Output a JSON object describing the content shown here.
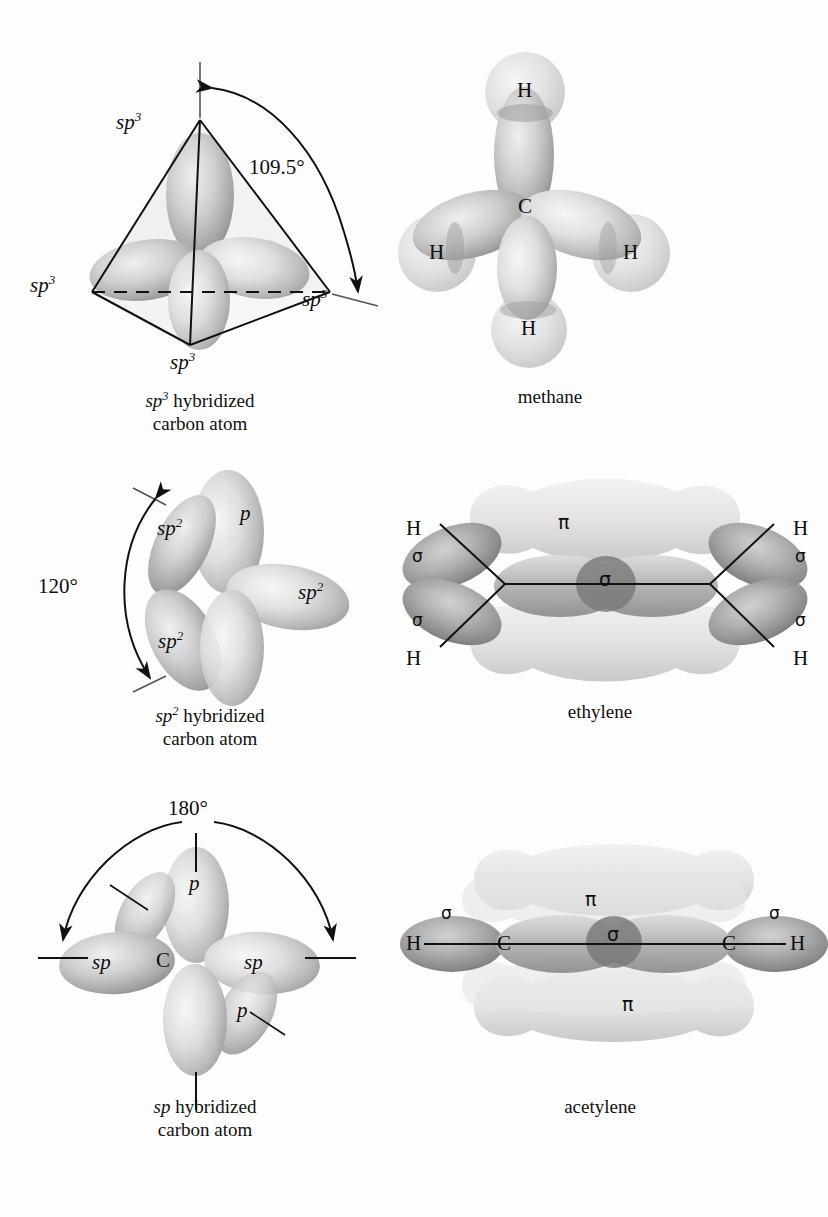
{
  "figure": {
    "background_color": "#fdfdfd",
    "ink_color": "#111111",
    "orbital_light": "#ececec",
    "orbital_mid": "#c9c9c9",
    "orbital_dark": "#8f8f8f",
    "orbital_shadow": "#6f6f6f"
  },
  "panels": [
    {
      "id": "sp3-carbon",
      "caption_line1_pre": "sp",
      "caption_line1_sup": "3",
      "caption_line1_post": " hybridized",
      "caption_line2": "carbon atom",
      "angle_label": "109.5°",
      "orbital_labels": [
        "sp3",
        "sp3",
        "sp3",
        "sp3"
      ],
      "orbital_label_text": "sp",
      "orbital_label_sup": "3"
    },
    {
      "id": "methane",
      "caption_line1_pre": "methane",
      "caption_line1_sup": "",
      "caption_line1_post": "",
      "caption_line2": "",
      "center_atom": "C",
      "hydrogen_labels": [
        "H",
        "H",
        "H",
        "H"
      ]
    },
    {
      "id": "sp2-carbon",
      "caption_line1_pre": "sp",
      "caption_line1_sup": "2",
      "caption_line1_post": " hybridized",
      "caption_line2": "carbon atom",
      "angle_label": "120°",
      "p_label": "p",
      "orbital_label_text": "sp",
      "orbital_label_sup": "2"
    },
    {
      "id": "ethylene",
      "caption_line1_pre": "ethylene",
      "caption_line1_sup": "",
      "caption_line1_post": "",
      "caption_line2": "",
      "pi_label": "π",
      "sigma_label": "σ",
      "hydrogen_labels": [
        "H",
        "H",
        "H",
        "H"
      ],
      "sigma_labels": [
        "σ",
        "σ",
        "σ",
        "σ",
        "σ"
      ]
    },
    {
      "id": "sp-carbon",
      "caption_line1_pre": "sp",
      "caption_line1_sup": "",
      "caption_line1_post": " hybridized",
      "caption_line2": "carbon atom",
      "angle_label": "180°",
      "center_atom": "C",
      "p_labels": [
        "p",
        "p"
      ],
      "sp_labels": [
        "sp",
        "sp"
      ]
    },
    {
      "id": "acetylene",
      "caption_line1_pre": "acetylene",
      "caption_line1_sup": "",
      "caption_line1_post": "",
      "caption_line2": "",
      "pi_labels": [
        "π",
        "π"
      ],
      "sigma_labels": [
        "σ",
        "σ",
        "σ"
      ],
      "carbon_labels": [
        "C",
        "C"
      ],
      "hydrogen_labels": [
        "H",
        "H"
      ]
    }
  ],
  "labels": {
    "sp3_a": "sp",
    "sp3_b": "sp",
    "sp3_c": "sp",
    "sp3_d": "sp",
    "sup3": "3",
    "sup2": "2",
    "angle_109": "109.5°",
    "angle_120": "120°",
    "angle_180": "180°",
    "C": "C",
    "H": "H",
    "p": "p",
    "sp": "sp",
    "sigma": "σ",
    "pi": "π"
  },
  "captions": {
    "sp3_l1_pre": "sp",
    "sp3_l1_sup": "3",
    "sp3_l1_post": " hybridized",
    "sp3_l2": "carbon atom",
    "methane": "methane",
    "sp2_l1_pre": "sp",
    "sp2_l1_sup": "2",
    "sp2_l1_post": " hybridized",
    "sp2_l2": "carbon atom",
    "ethylene": "ethylene",
    "sp_l1_pre": "sp",
    "sp_l1_post": " hybridized",
    "sp_l2": "carbon atom",
    "acetylene": "acetylene"
  }
}
